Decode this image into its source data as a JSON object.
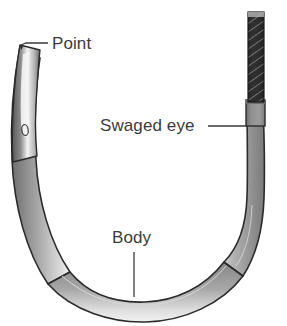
{
  "figure": {
    "background_color": "#ffffff",
    "width": 287,
    "height": 326
  },
  "labels": [
    {
      "id": "point",
      "text": "Point",
      "text_x": 52,
      "text_y": 49,
      "leader": "M 21,45 L 26,43 L 48,43"
    },
    {
      "id": "swaged-eye",
      "text": "Swaged eye",
      "text_x": 100,
      "text_y": 131,
      "leader": "M 208,126 L 247,126"
    },
    {
      "id": "body",
      "text": "Body",
      "text_x": 112,
      "text_y": 243,
      "leader": "M 134,252 L 134,297"
    }
  ],
  "parts": {
    "needle": {
      "name": "needle-body",
      "fill_color": "#8d8d8d",
      "outline_color": "#2b2b2b",
      "highlight_color": "#ededed"
    },
    "point": {
      "name": "needle-point",
      "fill_color": "#707070",
      "highlight_color": "#f2f2f2"
    },
    "swaged_eye": {
      "name": "swaged-eye-section",
      "fill_color": "#8d8d8d"
    },
    "suture": {
      "name": "suture-strand",
      "fill_color": "#2e2e2e",
      "hatch_color": "#b9b9b9"
    }
  },
  "colors": {
    "text": "#3b3b3b",
    "leader_line": "#3b3b3b",
    "metal_gray": "#8d8d8d",
    "metal_dark": "#2b2b2b",
    "metal_light": "#ededed",
    "suture_dark": "#2e2e2e"
  }
}
